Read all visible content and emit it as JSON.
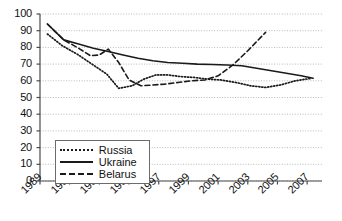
{
  "chart_data": {
    "type": "line",
    "title": "",
    "subtitle": "",
    "xlabel": "",
    "ylabel": "",
    "xlim": [
      1989,
      2008
    ],
    "ylim": [
      0,
      100
    ],
    "ytick_step": 10,
    "grid": "horizontal-dotted",
    "legend_position": "bottom-left",
    "yticks": [
      "100",
      "90",
      "80",
      "70",
      "60",
      "50",
      "40",
      "30",
      "20",
      "10",
      "0"
    ],
    "xticks": [
      "1989",
      "1991",
      "1993",
      "1995",
      "1997",
      "1999",
      "2001",
      "2003",
      "2005",
      "2007"
    ],
    "series": [
      {
        "name": "Russia",
        "style": "dotted",
        "color": "#1a1a1a",
        "x": [
          1989.5,
          1990.5,
          1991.5,
          1992.5,
          1993.5,
          1994.3,
          1995.2,
          1996.0,
          1996.8,
          1997.6,
          1998.5,
          1999.4,
          2000.3,
          2001.2,
          2002.2,
          2003.2,
          2004.2,
          2005.2,
          2006.2,
          2007.3
        ],
        "y": [
          88,
          81,
          76,
          70,
          64,
          55.5,
          57,
          61,
          63.5,
          63.5,
          62.5,
          62,
          61,
          60.5,
          59,
          57,
          56,
          57.5,
          60,
          61.5
        ]
      },
      {
        "name": "Ukraine",
        "style": "solid",
        "color": "#1a1a1a",
        "x": [
          1989.5,
          1990.6,
          1991.6,
          1992.6,
          1993.6,
          1994.6,
          1995.6,
          1996.6,
          1997.6,
          1998.6,
          1999.6,
          2000.6,
          2001.6,
          2002.6,
          2003.6,
          2004.6,
          2005.6,
          2006.6,
          2007.4
        ],
        "y": [
          94,
          84.5,
          82,
          79.5,
          77.5,
          75.5,
          73.5,
          72,
          71,
          70.5,
          70,
          69.8,
          69.5,
          69,
          67.5,
          66,
          64.5,
          63,
          61.5
        ]
      },
      {
        "name": "Belarus",
        "style": "dashed",
        "color": "#1a1a1a",
        "x": [
          1989.5,
          1990.6,
          1991.6,
          1992.4,
          1993.0,
          1993.6,
          1994.3,
          1995.0,
          1995.8,
          1996.6,
          1997.4,
          1998.3,
          1999.2,
          2000.1,
          2001.0,
          2002.0,
          2003.0,
          2004.2
        ],
        "y": [
          94,
          84.5,
          79.5,
          75,
          75.5,
          79,
          71,
          60.5,
          57,
          57.5,
          58,
          59,
          60,
          60.5,
          63,
          69.5,
          78,
          89
        ]
      }
    ]
  },
  "legend": {
    "items": [
      {
        "label": "Russia",
        "style": "dotted"
      },
      {
        "label": "Ukraine",
        "style": "solid"
      },
      {
        "label": "Belarus",
        "style": "dashed"
      }
    ]
  }
}
